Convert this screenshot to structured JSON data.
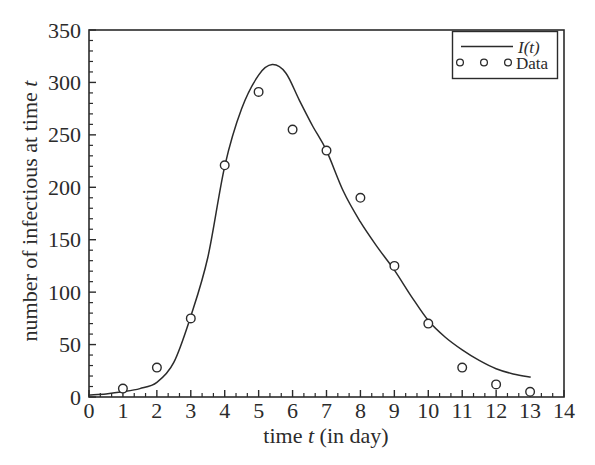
{
  "figure": {
    "background": "#ffffff",
    "ink": "#2b2b2b"
  },
  "chart_data": {
    "type": "line",
    "title": "",
    "xlabel": "time t (in day)",
    "xlabel_parts": {
      "pre": "time ",
      "var": "t",
      "post": " (in day)"
    },
    "ylabel": "number of infectious at time t",
    "ylabel_parts": {
      "pre": "number of infectious at time ",
      "var": "t"
    },
    "xlim": [
      0,
      14
    ],
    "ylim": [
      0,
      350
    ],
    "x_major_ticks": [
      0,
      1,
      2,
      3,
      4,
      5,
      6,
      7,
      8,
      9,
      10,
      11,
      12,
      13,
      14
    ],
    "x_minor_divisions": 3,
    "y_major_ticks": [
      0,
      50,
      100,
      150,
      200,
      250,
      300,
      350
    ],
    "y_minor_step": 10,
    "grid": false,
    "legend": {
      "position": "top-right",
      "entries": [
        {
          "label": "I(t)",
          "marker": "line"
        },
        {
          "label": "Data",
          "marker": "open-circles"
        }
      ]
    },
    "series": [
      {
        "name": "I(t)",
        "type": "line",
        "x": [
          0,
          0.5,
          1,
          1.5,
          2,
          2.5,
          3,
          3.5,
          4,
          4.5,
          5,
          5.4,
          5.8,
          6.2,
          6.6,
          7,
          7.5,
          8,
          8.5,
          9,
          9.5,
          10,
          10.5,
          11,
          11.5,
          12,
          12.5,
          13
        ],
        "y": [
          2,
          3,
          5,
          8,
          14,
          33,
          77,
          133,
          220,
          275,
          307,
          317,
          309,
          283,
          258,
          235,
          196,
          167,
          143,
          121,
          96,
          73,
          57,
          45,
          35,
          27,
          22,
          19
        ]
      },
      {
        "name": "Data",
        "type": "scatter",
        "x": [
          1,
          2,
          3,
          4,
          5,
          6,
          7,
          8,
          9,
          10,
          11,
          12,
          13
        ],
        "y": [
          8,
          28,
          75,
          221,
          291,
          255,
          235,
          190,
          125,
          70,
          28,
          12,
          5
        ]
      }
    ]
  }
}
